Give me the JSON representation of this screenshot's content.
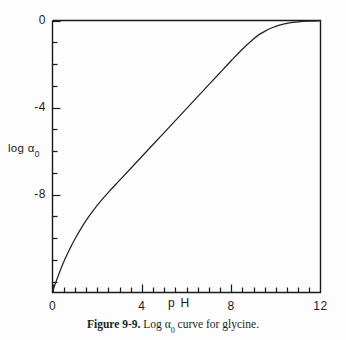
{
  "figure": {
    "caption_label": "Figure 9-9.",
    "caption_text_1": " Log α",
    "caption_sub": "0",
    "caption_text_2": " curve for glycine."
  },
  "axes": {
    "x_title": "p H",
    "y_title_main": "log α",
    "y_title_sub": "0",
    "x_tick_labels": [
      "0",
      "4",
      "8",
      "12"
    ],
    "y_tick_labels": [
      "0",
      "-4",
      "-8"
    ],
    "frame_color": "#1a1a1a",
    "curve_color": "#232323"
  },
  "chart_data": {
    "type": "line",
    "xlabel": "p H",
    "ylabel": "log α₀",
    "xlim": [
      0,
      12
    ],
    "ylim": [
      -12.5,
      0
    ],
    "grid": false,
    "legend": "none",
    "x_ticks_major": [
      0,
      4,
      8,
      12
    ],
    "x_ticks_minor_step": 0.5,
    "y_ticks_major": [
      0,
      -4,
      -8
    ],
    "y_ticks_minor_step": 1,
    "series": [
      {
        "name": "log α₀ (glycine)",
        "x": [
          0.0,
          0.25,
          0.5,
          0.75,
          1.0,
          1.5,
          2.0,
          2.5,
          3.0,
          3.5,
          4.0,
          4.5,
          5.0,
          5.5,
          6.0,
          6.5,
          7.0,
          7.5,
          8.0,
          8.5,
          9.0,
          9.25,
          9.5,
          9.75,
          10.0,
          10.25,
          10.5,
          10.75,
          11.0,
          11.5,
          12.0
        ],
        "y": [
          -12.45,
          -11.75,
          -11.1,
          -10.55,
          -10.05,
          -9.2,
          -8.5,
          -7.9,
          -7.35,
          -6.8,
          -6.25,
          -5.7,
          -5.15,
          -4.6,
          -4.05,
          -3.5,
          -2.95,
          -2.4,
          -1.85,
          -1.32,
          -0.85,
          -0.65,
          -0.5,
          -0.37,
          -0.27,
          -0.19,
          -0.13,
          -0.09,
          -0.06,
          -0.03,
          -0.01
        ]
      }
    ]
  }
}
